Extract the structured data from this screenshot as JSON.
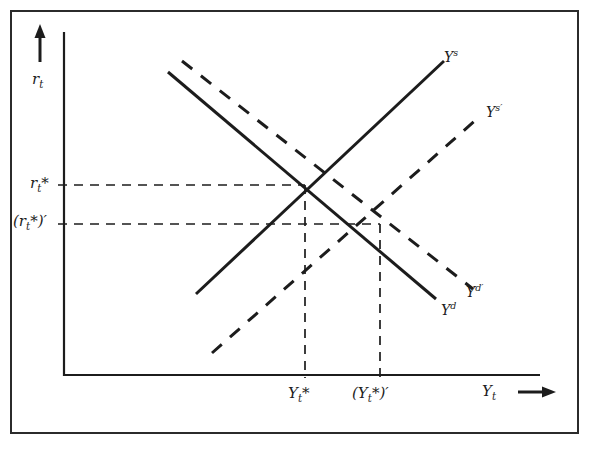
{
  "figure": {
    "kind": "economics-supply-demand-shift-diagram",
    "frame": {
      "border_color": "#2b2b2b"
    },
    "ink_color": "#1c1c1c",
    "axes": {
      "y_axis": {
        "name": "vertical-axis",
        "label_html": "r<sub>t</sub>",
        "label_plain": "r_t",
        "arrow": "up"
      },
      "x_axis": {
        "name": "horizontal-axis",
        "label_html": "Y<sub>t</sub>",
        "label_plain": "Y_t",
        "arrow": "right",
        "arrow_glyph": "→"
      }
    },
    "y_ticks": [
      {
        "id": "r-star",
        "label_html": "r<sub>t</sub><span class=\"star\">*</span>",
        "label_plain": "r_t*"
      },
      {
        "id": "r-star-prime",
        "label_html": "(r<sub>t</sub><span class=\"star\">*</span>)′",
        "label_plain": "(r_t*)'"
      }
    ],
    "x_ticks": [
      {
        "id": "Y-star",
        "label_html": "Y<sub>t</sub><span class=\"star\">*</span>",
        "label_plain": "Y_t*"
      },
      {
        "id": "Y-star-prime",
        "label_html": "(Y<sub>t</sub><span class=\"star\">*</span>)′",
        "label_plain": "(Y_t*)'"
      }
    ],
    "curves": [
      {
        "id": "supply",
        "label_html": "Y<sup>s</sup>",
        "label_plain": "Y^s",
        "style": "solid",
        "slope": "upward"
      },
      {
        "id": "supply-shifted",
        "label_html": "Y<sup>s′</sup>",
        "label_plain": "Y^s'",
        "style": "dashed",
        "slope": "upward"
      },
      {
        "id": "demand",
        "label_html": "Y<sup>d</sup>",
        "label_plain": "Y^d",
        "style": "solid",
        "slope": "downward"
      },
      {
        "id": "demand-shifted",
        "label_html": "Y<sup>d′</sup>",
        "label_plain": "Y^d'",
        "style": "dashed",
        "slope": "downward"
      }
    ]
  },
  "chart_data": {
    "type": "line",
    "title": "",
    "xlabel": "Y_t",
    "ylabel": "r_t",
    "grid": false,
    "legend": "inline-curve-labels",
    "xlim": [
      0,
      100
    ],
    "ylim": [
      0,
      100
    ],
    "xticks": [
      {
        "value": 51,
        "label": "Y_t*"
      },
      {
        "value": 66,
        "label": "(Y_t*)'"
      }
    ],
    "yticks": [
      {
        "value": 55,
        "label": "r_t*"
      },
      {
        "value": 44,
        "label": "(r_t*)'"
      }
    ],
    "series": [
      {
        "name": "Y^s",
        "style": "solid",
        "x": [
          27,
          80
        ],
        "y": [
          23,
          83
        ]
      },
      {
        "name": "Y^s'",
        "style": "dashed",
        "x": [
          31,
          88
        ],
        "y": [
          6,
          69
        ]
      },
      {
        "name": "Y^d",
        "style": "solid",
        "x": [
          22,
          76
        ],
        "y": [
          88,
          22
        ]
      },
      {
        "name": "Y^d'",
        "style": "dashed",
        "x": [
          25,
          84
        ],
        "y": [
          91,
          25
        ]
      }
    ],
    "annotations": [
      {
        "label": "equilibrium-1",
        "x": 51,
        "y": 55
      },
      {
        "label": "equilibrium-2",
        "x": 66,
        "y": 44
      }
    ],
    "guides": [
      {
        "from": [
          0,
          55
        ],
        "to": [
          51,
          55
        ],
        "style": "dashed",
        "orientation": "horizontal"
      },
      {
        "from": [
          0,
          44
        ],
        "to": [
          66,
          44
        ],
        "style": "dashed",
        "orientation": "horizontal"
      },
      {
        "from": [
          51,
          0
        ],
        "to": [
          51,
          55
        ],
        "style": "dashed",
        "orientation": "vertical"
      },
      {
        "from": [
          66,
          0
        ],
        "to": [
          66,
          44
        ],
        "style": "dashed",
        "orientation": "vertical"
      }
    ]
  }
}
